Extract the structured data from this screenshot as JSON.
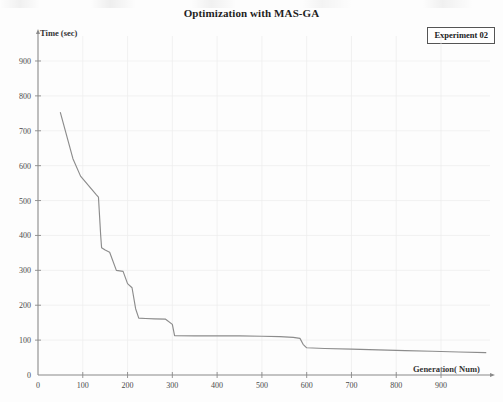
{
  "chart_data": {
    "type": "line",
    "title": "Optimization with MAS-GA",
    "xlabel": "Generation( Num)",
    "ylabel": "Time (sec)",
    "legend": [
      "Experiment 02"
    ],
    "legend_position": "top-right",
    "grid": true,
    "xlim": [
      0,
      1000
    ],
    "ylim": [
      0,
      950
    ],
    "xticks": [
      0,
      100,
      200,
      300,
      400,
      500,
      600,
      700,
      800,
      900
    ],
    "yticks": [
      0,
      100,
      200,
      300,
      400,
      500,
      600,
      700,
      800,
      900
    ],
    "series": [
      {
        "name": "Experiment 02",
        "x": [
          50,
          78,
          95,
          130,
          135,
          140,
          142,
          150,
          160,
          175,
          190,
          200,
          210,
          218,
          225,
          240,
          260,
          285,
          300,
          305,
          350,
          400,
          450,
          500,
          540,
          570,
          585,
          592,
          600,
          640,
          700,
          760,
          820,
          880,
          940,
          1000
        ],
        "y": [
          752,
          620,
          570,
          517,
          510,
          400,
          365,
          358,
          352,
          300,
          297,
          262,
          250,
          190,
          163,
          162,
          161,
          160,
          145,
          113,
          112,
          112,
          112,
          111,
          110,
          108,
          105,
          88,
          78,
          76,
          74,
          72,
          70,
          68,
          66,
          64
        ]
      }
    ]
  },
  "axes": {
    "x_tick_labels": [
      "0",
      "100",
      "200",
      "300",
      "400",
      "500",
      "600",
      "700",
      "800",
      "900"
    ],
    "y_tick_labels": [
      "0",
      "100",
      "200",
      "300",
      "400",
      "500",
      "600",
      "700",
      "800",
      "900"
    ],
    "origin_label": "0"
  },
  "style": {
    "line_color": "#8c8c8c",
    "axis_color": "#8a8a8a",
    "grid_color": "#ededed",
    "text_color": "#3a3a3a"
  }
}
